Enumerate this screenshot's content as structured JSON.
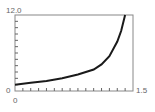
{
  "chart_data": {
    "type": "line",
    "title": "",
    "xlabel": "",
    "ylabel": "",
    "xlim": [
      0,
      1.5
    ],
    "ylim": [
      0,
      12.0
    ],
    "grid": false,
    "x_tick_labels": {
      "min": "0",
      "max": "1.5"
    },
    "y_tick_labels": {
      "min": "0",
      "max": "12.0"
    },
    "x_minor_ticks": 15,
    "y_minor_ticks": 12,
    "series": [
      {
        "name": "curve",
        "x": [
          0,
          0.2,
          0.4,
          0.6,
          0.8,
          1.0,
          1.1,
          1.2,
          1.3,
          1.35,
          1.4
        ],
        "y": [
          1.0,
          1.3,
          1.6,
          2.0,
          2.6,
          3.4,
          4.2,
          5.5,
          7.8,
          9.5,
          12.0
        ]
      }
    ],
    "line_color": "#1a1a1a"
  },
  "labels": {
    "y_max": "12.0",
    "y_min": "0",
    "x_min": "0",
    "x_max": "1.5"
  }
}
